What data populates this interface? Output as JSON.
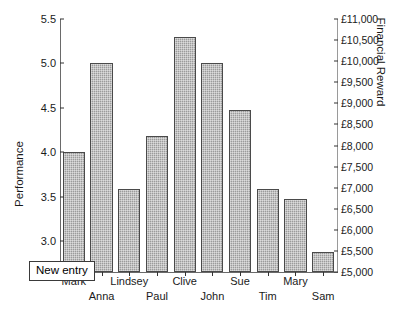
{
  "chart_data": {
    "type": "bar",
    "title": "",
    "categories": [
      "Mark",
      "Anna",
      "Lindsey",
      "Paul",
      "Clive",
      "John",
      "Sue",
      "Tim",
      "Mary",
      "Sam"
    ],
    "values": [
      4.0,
      5.0,
      3.58,
      4.18,
      5.3,
      5.0,
      4.48,
      3.58,
      3.47,
      2.88
    ],
    "xlabel": "",
    "ylabel": "Performance",
    "ylim": [
      2.65,
      5.5
    ],
    "yticks": [
      3.0,
      3.5,
      4.0,
      4.5,
      5.0,
      5.5
    ],
    "ytick_labels": [
      "3.0",
      "3.5",
      "4.0",
      "4.5",
      "5.0",
      "5.5"
    ],
    "y2label": "Financial Reward",
    "y2lim": [
      5000,
      11000
    ],
    "y2ticks": [
      5000,
      5500,
      6000,
      6500,
      7000,
      7500,
      8000,
      8500,
      9000,
      9500,
      10000,
      10500,
      11000
    ],
    "y2tick_labels": [
      "£5,000",
      "£5,500",
      "£6,000",
      "£6,500",
      "£7,000",
      "£7,500",
      "£8,000",
      "£8,500",
      "£9,000",
      "£9,500",
      "£10,000",
      "£10,500",
      "£11,000"
    ],
    "grid": false,
    "legend": "none",
    "bar_color": "#9b9b9b",
    "bar_edge_color": "#4a4a4a",
    "annotations": [
      {
        "text": "New entry",
        "kind": "textbox"
      }
    ]
  },
  "axis": {
    "left_title": "Performance",
    "right_title": "Financial Reward"
  },
  "annotation": {
    "new_entry_label": "New entry"
  }
}
